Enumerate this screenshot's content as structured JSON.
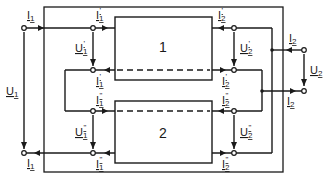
{
  "diagram": {
    "blocks": [
      {
        "id": "block-1",
        "label": "1"
      },
      {
        "id": "block-2",
        "label": "2"
      }
    ],
    "labels": {
      "I1_top": "I",
      "I1_top_sub": "1",
      "I1_bottom": "I",
      "I1_bottom_sub": "1",
      "U1": "U",
      "U1_sub": "1",
      "I1p_top": "I",
      "I1p_top_sub": "1",
      "I1p_top_sup": "'",
      "U1p": "U",
      "U1p_sub": "1",
      "U1p_sup": "'",
      "I1p_mid": "I",
      "I1p_mid_sub": "1",
      "I1p_mid_sup": "'",
      "I1pp_mid": "I",
      "I1pp_mid_sub": "1",
      "I1pp_mid_sup": "\"",
      "U1pp": "U",
      "U1pp_sub": "1",
      "U1pp_sup": "\"",
      "I1pp_bottom": "I",
      "I1pp_bottom_sub": "1",
      "I1pp_bottom_sup": "\"",
      "I2p_top": "I",
      "I2p_top_sub": "2",
      "I2p_top_sup": "'",
      "U2p": "U",
      "U2p_sub": "2",
      "U2p_sup": "'",
      "I2p_mid": "I",
      "I2p_mid_sub": "2",
      "I2p_mid_sup": "'",
      "I2pp_mid": "I",
      "I2pp_mid_sub": "2",
      "I2pp_mid_sup": "\"",
      "U2pp": "U",
      "U2pp_sub": "2",
      "U2pp_sup": "\"",
      "I2pp_bottom": "I",
      "I2pp_bottom_sub": "2",
      "I2pp_bottom_sup": "\"",
      "I2_top": "I",
      "I2_top_sub": "2",
      "U2": "U",
      "U2_sub": "2",
      "I2_bottom": "I",
      "I2_bottom_sub": "2"
    },
    "colors": {
      "ink": "#1a1a1a",
      "background": "#ffffff"
    }
  }
}
